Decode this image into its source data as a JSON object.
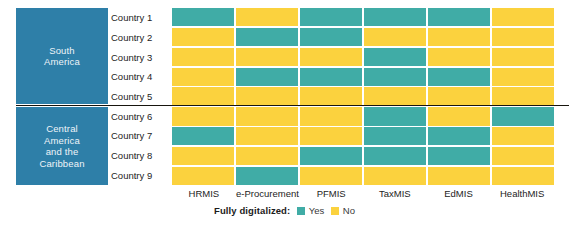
{
  "chart_data": {
    "type": "heatmap",
    "title": "",
    "xlabel": "",
    "ylabel": "",
    "categories": [
      "HRMIS",
      "e-Procurement",
      "PFMIS",
      "TaxMIS",
      "EdMIS",
      "HealthMIS"
    ],
    "rows": [
      "Country 1",
      "Country 2",
      "Country 3",
      "Country 4",
      "Country 5",
      "Country 6",
      "Country 7",
      "Country 8",
      "Country 9"
    ],
    "value_labels": {
      "1": "Yes",
      "0": "No"
    },
    "colors": {
      "yes": "#40aca6",
      "no": "#fbd23e",
      "region_panel": "#2e7fa8",
      "divider": "#17150e"
    },
    "series": [
      {
        "name": "Country 1",
        "values": [
          1,
          0,
          1,
          1,
          1,
          0
        ]
      },
      {
        "name": "Country 2",
        "values": [
          0,
          1,
          1,
          0,
          0,
          0
        ]
      },
      {
        "name": "Country 3",
        "values": [
          0,
          0,
          0,
          1,
          0,
          0
        ]
      },
      {
        "name": "Country 4",
        "values": [
          0,
          1,
          1,
          1,
          1,
          0
        ]
      },
      {
        "name": "Country 5",
        "values": [
          0,
          0,
          0,
          0,
          0,
          0
        ]
      },
      {
        "name": "Country 6",
        "values": [
          0,
          0,
          0,
          1,
          0,
          1
        ]
      },
      {
        "name": "Country 7",
        "values": [
          1,
          0,
          0,
          1,
          1,
          0
        ]
      },
      {
        "name": "Country 8",
        "values": [
          0,
          0,
          1,
          1,
          1,
          0
        ]
      },
      {
        "name": "Country 9",
        "values": [
          0,
          1,
          0,
          0,
          0,
          0
        ]
      }
    ],
    "legend": {
      "position": "bottom-center",
      "title": "Fully digitalized:",
      "entries": [
        {
          "label": "Yes",
          "color": "#40aca6"
        },
        {
          "label": "No",
          "color": "#fbd23e"
        }
      ]
    },
    "grid": false
  },
  "regions": [
    {
      "name": "South America",
      "line1": "South",
      "line2": "America",
      "rows": [
        "Country 1",
        "Country 2",
        "Country 3",
        "Country 4",
        "Country 5"
      ]
    },
    {
      "name": "Central America and the Caribbean",
      "line1": "Central",
      "line2": "America",
      "line3": "and the",
      "line4": "Caribbean",
      "rows": [
        "Country 6",
        "Country 7",
        "Country 8",
        "Country 9"
      ]
    }
  ],
  "legend": {
    "title": "Fully digitalized:",
    "yes_label": "Yes",
    "no_label": "No"
  }
}
